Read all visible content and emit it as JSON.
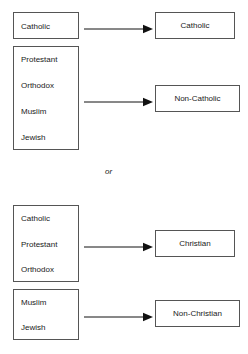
{
  "diagram": {
    "title_visible": false,
    "connector_label": "or",
    "colors": {
      "background": "#ffffff",
      "border": "#555555",
      "text": "#1a1a1a",
      "arrow": "#111111"
    },
    "schemes": [
      {
        "name": "catholic-scheme",
        "groups": [
          {
            "name": "group-catholic-source",
            "items": [
              "Catholic"
            ],
            "box": {
              "x": 13,
              "y": 12,
              "w": 66,
              "h": 27
            }
          },
          {
            "name": "group-non-catholic-source",
            "items": [
              "Protestant",
              "Orthodox",
              "Muslim",
              "Jewish"
            ],
            "box": {
              "x": 13,
              "y": 46,
              "w": 66,
              "h": 104
            }
          }
        ],
        "outputs": [
          {
            "name": "output-catholic",
            "label": "Catholic",
            "box": {
              "x": 155,
              "y": 12,
              "w": 80,
              "h": 27
            }
          },
          {
            "name": "output-non-catholic",
            "label": "Non-Catholic",
            "box": {
              "x": 155,
              "y": 85,
              "w": 85,
              "h": 27
            }
          }
        ],
        "arrows": [
          {
            "name": "arrow-catholic",
            "x1": 84,
            "y": 25,
            "x2": 153
          },
          {
            "name": "arrow-non-catholic",
            "x1": 84,
            "y": 98,
            "x2": 153
          }
        ]
      },
      {
        "name": "christian-scheme",
        "groups": [
          {
            "name": "group-christian-source",
            "items": [
              "Catholic",
              "Protestant",
              "Orthodox"
            ],
            "box": {
              "x": 13,
              "y": 205,
              "w": 66,
              "h": 77
            }
          },
          {
            "name": "group-non-christian-source",
            "items": [
              "Muslim",
              "Jewish"
            ],
            "box": {
              "x": 13,
              "y": 289,
              "w": 66,
              "h": 51
            }
          }
        ],
        "outputs": [
          {
            "name": "output-christian",
            "label": "Christian",
            "box": {
              "x": 155,
              "y": 230,
              "w": 80,
              "h": 27
            }
          },
          {
            "name": "output-non-christian",
            "label": "Non-Christian",
            "box": {
              "x": 155,
              "y": 300,
              "w": 85,
              "h": 27
            }
          }
        ],
        "arrows": [
          {
            "name": "arrow-christian",
            "x1": 84,
            "y": 243,
            "x2": 153
          },
          {
            "name": "arrow-non-christian",
            "x1": 84,
            "y": 313,
            "x2": 153
          }
        ]
      }
    ],
    "or_position": {
      "x": 105,
      "y": 167
    }
  }
}
